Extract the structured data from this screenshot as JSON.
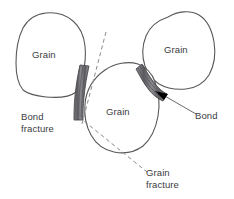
{
  "figure": {
    "background_color": "#ffffff",
    "outline_color": "#58585a",
    "bond_color": "#7a7a7e",
    "dashed_color": "#8a8a8e",
    "text_color": "#3b3b3d",
    "arrow_color": "#000000"
  },
  "grains": [
    {
      "id": "left",
      "label": "Grain"
    },
    {
      "id": "right",
      "label": "Grain"
    },
    {
      "id": "center",
      "label": "Grain"
    }
  ],
  "annotations": {
    "bond_fracture": {
      "line1": "Bond",
      "line2": "fracture"
    },
    "grain_fracture": {
      "line1": "Grain",
      "line2": "fracture"
    },
    "bond": {
      "label": "Bond"
    }
  }
}
